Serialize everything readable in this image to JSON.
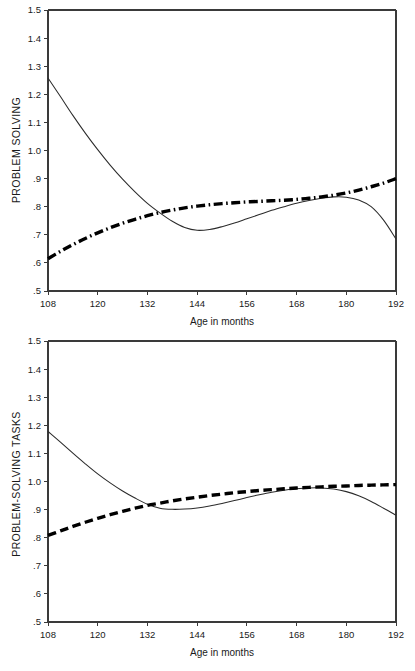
{
  "chart_data": [
    {
      "type": "line",
      "title": "",
      "xlabel": "Age in months",
      "ylabel": "PROBLEM SOLVING",
      "xlim": [
        108,
        192
      ],
      "ylim": [
        0.5,
        1.5
      ],
      "xticks": [
        108,
        120,
        132,
        144,
        156,
        168,
        180,
        192
      ],
      "xticklabels": [
        "108",
        "120",
        "132",
        "144",
        "156",
        "168",
        "180",
        "192"
      ],
      "yticks": [
        0.5,
        0.6,
        0.7,
        0.8,
        0.9,
        1.0,
        1.1,
        1.2,
        1.3,
        1.4,
        1.5
      ],
      "yticklabels": [
        ".5",
        ".6",
        ".7",
        ".8",
        ".9",
        "1.0",
        "1.1",
        "1.2",
        "1.3",
        "1.4",
        "1.5"
      ],
      "grid": false,
      "legend": "none",
      "series": [
        {
          "name": "observed",
          "style": "solid-thin",
          "color": "#2b2b2b",
          "x": [
            108,
            111,
            114,
            117,
            120,
            123,
            126,
            129,
            132,
            135,
            138,
            141,
            144,
            147,
            150,
            153,
            156,
            159,
            162,
            165,
            168,
            171,
            174,
            177,
            180,
            183,
            186,
            189,
            192
          ],
          "y": [
            1.258,
            1.192,
            1.125,
            1.062,
            1.003,
            0.948,
            0.898,
            0.853,
            0.812,
            0.778,
            0.748,
            0.726,
            0.716,
            0.719,
            0.729,
            0.742,
            0.757,
            0.772,
            0.787,
            0.8,
            0.812,
            0.822,
            0.83,
            0.835,
            0.834,
            0.824,
            0.8,
            0.752,
            0.685
          ]
        },
        {
          "name": "predicted",
          "style": "dash-dot-thick",
          "color": "#000000",
          "x": [
            108,
            111,
            114,
            117,
            120,
            123,
            126,
            129,
            132,
            135,
            138,
            141,
            144,
            147,
            150,
            153,
            156,
            159,
            162,
            165,
            168,
            171,
            174,
            177,
            180,
            183,
            186,
            189,
            192
          ],
          "y": [
            0.615,
            0.641,
            0.665,
            0.687,
            0.707,
            0.725,
            0.741,
            0.755,
            0.768,
            0.779,
            0.788,
            0.796,
            0.802,
            0.807,
            0.811,
            0.814,
            0.817,
            0.819,
            0.821,
            0.823,
            0.826,
            0.83,
            0.835,
            0.841,
            0.849,
            0.859,
            0.871,
            0.884,
            0.9
          ]
        }
      ]
    },
    {
      "type": "line",
      "title": "",
      "xlabel": "Age in months",
      "ylabel": "PROBLEM-SOLVING TASKS",
      "xlim": [
        108,
        192
      ],
      "ylim": [
        0.5,
        1.5
      ],
      "xticks": [
        108,
        120,
        132,
        144,
        156,
        168,
        180,
        192
      ],
      "xticklabels": [
        "108",
        "120",
        "132",
        "144",
        "156",
        "168",
        "180",
        "192"
      ],
      "yticks": [
        0.5,
        0.6,
        0.7,
        0.8,
        0.9,
        1.0,
        1.1,
        1.2,
        1.3,
        1.4,
        1.5
      ],
      "yticklabels": [
        ".5",
        ".6",
        ".7",
        ".8",
        ".9",
        "1.0",
        "1.1",
        "1.2",
        "1.3",
        "1.4",
        "1.5"
      ],
      "grid": false,
      "legend": "none",
      "series": [
        {
          "name": "observed",
          "style": "solid-thin",
          "color": "#2b2b2b",
          "x": [
            108,
            111,
            114,
            117,
            120,
            123,
            126,
            129,
            132,
            135,
            138,
            141,
            144,
            147,
            150,
            153,
            156,
            159,
            162,
            165,
            168,
            171,
            174,
            177,
            180,
            183,
            186,
            189,
            192
          ],
          "y": [
            1.178,
            1.14,
            1.101,
            1.063,
            1.027,
            0.995,
            0.966,
            0.941,
            0.919,
            0.905,
            0.901,
            0.902,
            0.906,
            0.913,
            0.922,
            0.932,
            0.943,
            0.953,
            0.962,
            0.969,
            0.974,
            0.977,
            0.977,
            0.973,
            0.964,
            0.949,
            0.929,
            0.905,
            0.88
          ]
        },
        {
          "name": "predicted",
          "style": "dashed-thick",
          "color": "#000000",
          "x": [
            108,
            111,
            114,
            117,
            120,
            123,
            126,
            129,
            132,
            135,
            138,
            141,
            144,
            147,
            150,
            153,
            156,
            159,
            162,
            165,
            168,
            171,
            174,
            177,
            180,
            183,
            186,
            189,
            192
          ],
          "y": [
            0.808,
            0.824,
            0.84,
            0.855,
            0.869,
            0.882,
            0.894,
            0.905,
            0.915,
            0.923,
            0.931,
            0.938,
            0.944,
            0.95,
            0.955,
            0.96,
            0.964,
            0.968,
            0.971,
            0.974,
            0.977,
            0.979,
            0.981,
            0.983,
            0.984,
            0.986,
            0.987,
            0.988,
            0.989
          ]
        }
      ]
    }
  ]
}
